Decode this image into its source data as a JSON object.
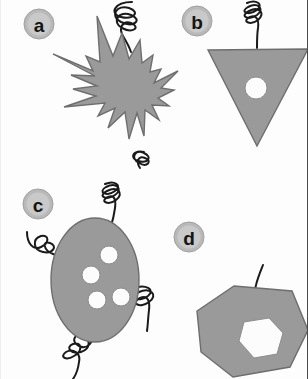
{
  "figure": {
    "title": "",
    "width": 308,
    "height": 379,
    "background_color": "#fdfdfd",
    "cell_fill_color": "#9a9a9a",
    "cell_stroke_color": "#6e6e6e",
    "organelle_fill_color": "#fcfcfc",
    "flagellum_color": "#1a1a1a",
    "badge_fill_color": "#c9c9c9",
    "badge_text_color": "#151515"
  },
  "panels": [
    {
      "label": "a",
      "badge_name": "panel-badge-a",
      "shape": "spiky-star-amoeboid-cell",
      "spike_count": 13,
      "organelle_count": 0,
      "flagella": [
        {
          "type": "helical-corkscrew",
          "position": "top",
          "turns": 3
        },
        {
          "type": "helical-corkscrew",
          "position": "bottom-right",
          "turns": 2
        }
      ]
    },
    {
      "label": "b",
      "badge_name": "panel-badge-b",
      "shape": "inverted-triangle-cell",
      "organelle_count": 1,
      "organelle_shape": "circle",
      "flagella": [
        {
          "type": "helical-corkscrew",
          "position": "top",
          "turns": 3
        }
      ]
    },
    {
      "label": "c",
      "badge_name": "panel-badge-c",
      "shape": "ellipse-cell",
      "organelle_count": 4,
      "organelle_shape": "circle",
      "flagella": [
        {
          "type": "helical-corkscrew",
          "position": "top",
          "turns": 3
        },
        {
          "type": "helical-corkscrew",
          "position": "left",
          "turns": 2
        },
        {
          "type": "helical-corkscrew",
          "position": "right",
          "turns": 2
        },
        {
          "type": "helical-corkscrew",
          "position": "bottom",
          "turns": 3
        }
      ]
    },
    {
      "label": "d",
      "badge_name": "panel-badge-d",
      "shape": "heptagon-cell",
      "organelle_count": 1,
      "organelle_shape": "hexagon",
      "flagella": [
        {
          "type": "straight-whip",
          "position": "top",
          "turns": 0
        }
      ]
    }
  ]
}
